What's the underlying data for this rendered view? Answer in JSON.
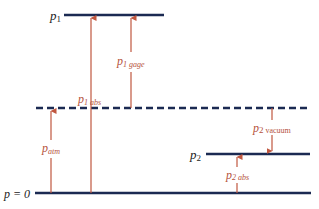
{
  "colors": {
    "level_line": "#1b2a52",
    "arrow": "#c0573f",
    "label_black": "#222222",
    "label_red": "#b5523c",
    "background": "#ffffff"
  },
  "levels": {
    "p1": {
      "symbol": "p",
      "subscript": "1"
    },
    "atm": {
      "style": "dashed"
    },
    "p2": {
      "symbol": "p",
      "subscript": "2"
    },
    "zero": {
      "label": "p = 0"
    }
  },
  "arrows": {
    "p1_abs": {
      "symbol": "p",
      "subscript": "1 abs"
    },
    "p1_gage": {
      "symbol": "p",
      "subscript": "1 gage"
    },
    "p_atm": {
      "symbol": "p",
      "subscript": "atm"
    },
    "p2_vacuum": {
      "symbol": "p",
      "subscript": "2",
      "suffix": "vacuum"
    },
    "p2_abs": {
      "symbol": "p",
      "subscript": "2 abs"
    }
  }
}
